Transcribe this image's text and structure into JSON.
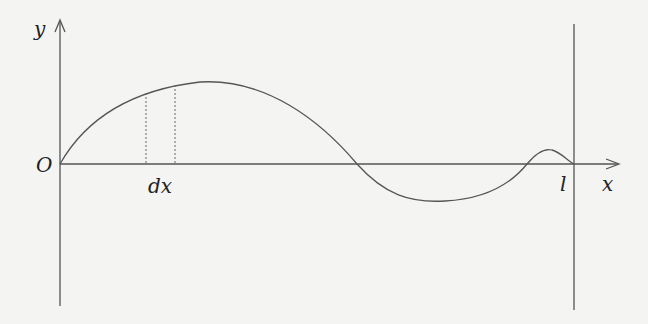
{
  "diagram": {
    "title": "",
    "labels": {
      "y_axis": "y",
      "x_axis": "x",
      "origin": "O",
      "element": "dx",
      "length": "l"
    },
    "colors": {
      "background": "#f4f4f2",
      "stroke": "#555555",
      "text": "#222222"
    }
  }
}
